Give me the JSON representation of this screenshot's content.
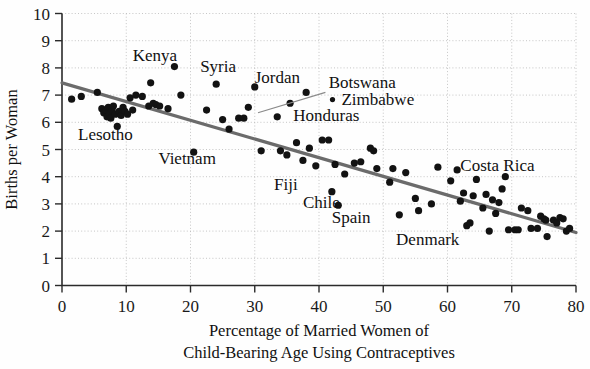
{
  "chart_data": {
    "type": "scatter",
    "title": "",
    "xlabel": "Percentage of Married Women of Child-Bearing Age Using Contraceptives",
    "xlabel_line1": "Percentage of Married Women of",
    "xlabel_line2": "Child-Bearing Age Using Contraceptives",
    "ylabel": "Births per Woman",
    "xlim": [
      0,
      80
    ],
    "ylim": [
      0,
      10
    ],
    "xticks": [
      0,
      10,
      20,
      30,
      40,
      50,
      60,
      70,
      80
    ],
    "yticks": [
      0,
      1,
      2,
      3,
      4,
      5,
      6,
      7,
      8,
      9,
      10
    ],
    "xtick_labels": [
      "0",
      "10",
      "20",
      "30",
      "40",
      "50",
      "60",
      "70",
      "80"
    ],
    "ytick_labels": [
      "0",
      "1",
      "2",
      "3",
      "4",
      "5",
      "6",
      "7",
      "8",
      "9",
      "10"
    ],
    "grid": true,
    "legend": "none",
    "marker_color": "#121212",
    "trend_color": "#6b6b6b",
    "trend_line": {
      "name": "least-squares regression line",
      "x1": 0,
      "y1": 7.45,
      "x2": 80,
      "y2": 1.95
    },
    "points": [
      {
        "x": 1.5,
        "y": 6.85
      },
      {
        "x": 3.0,
        "y": 6.95
      },
      {
        "x": 5.5,
        "y": 7.1
      },
      {
        "x": 6.2,
        "y": 6.5
      },
      {
        "x": 6.5,
        "y": 6.35
      },
      {
        "x": 6.8,
        "y": 6.45
      },
      {
        "x": 7.0,
        "y": 6.2
      },
      {
        "x": 7.2,
        "y": 6.55
      },
      {
        "x": 7.4,
        "y": 6.3
      },
      {
        "x": 7.6,
        "y": 6.15
      },
      {
        "x": 7.8,
        "y": 6.45
      },
      {
        "x": 8.0,
        "y": 6.6
      },
      {
        "x": 8.3,
        "y": 6.3
      },
      {
        "x": 8.6,
        "y": 5.85
      },
      {
        "x": 8.9,
        "y": 6.4
      },
      {
        "x": 9.2,
        "y": 6.25
      },
      {
        "x": 9.5,
        "y": 6.55
      },
      {
        "x": 9.8,
        "y": 6.4
      },
      {
        "x": 10.2,
        "y": 6.3
      },
      {
        "x": 10.6,
        "y": 6.9
      },
      {
        "x": 11.0,
        "y": 6.45
      },
      {
        "x": 11.5,
        "y": 7.0
      },
      {
        "x": 12.5,
        "y": 6.95
      },
      {
        "x": 13.5,
        "y": 6.6
      },
      {
        "x": 13.8,
        "y": 7.45
      },
      {
        "x": 14.2,
        "y": 6.7
      },
      {
        "x": 14.6,
        "y": 6.65
      },
      {
        "x": 15.2,
        "y": 6.6
      },
      {
        "x": 16.5,
        "y": 6.5
      },
      {
        "x": 17.5,
        "y": 8.05
      },
      {
        "x": 18.5,
        "y": 7.0
      },
      {
        "x": 20.5,
        "y": 4.9
      },
      {
        "x": 22.5,
        "y": 6.45
      },
      {
        "x": 24.0,
        "y": 7.4
      },
      {
        "x": 25.0,
        "y": 6.1
      },
      {
        "x": 26.0,
        "y": 5.75
      },
      {
        "x": 27.5,
        "y": 6.15
      },
      {
        "x": 28.3,
        "y": 6.15
      },
      {
        "x": 29.0,
        "y": 6.55
      },
      {
        "x": 30.0,
        "y": 7.3
      },
      {
        "x": 31.0,
        "y": 4.95
      },
      {
        "x": 33.5,
        "y": 6.2
      },
      {
        "x": 34.0,
        "y": 4.95
      },
      {
        "x": 35.0,
        "y": 4.8
      },
      {
        "x": 35.5,
        "y": 6.7
      },
      {
        "x": 36.5,
        "y": 5.25
      },
      {
        "x": 37.5,
        "y": 4.6
      },
      {
        "x": 38.0,
        "y": 7.1
      },
      {
        "x": 38.5,
        "y": 5.05
      },
      {
        "x": 39.5,
        "y": 4.4
      },
      {
        "x": 40.5,
        "y": 5.35
      },
      {
        "x": 41.5,
        "y": 5.35
      },
      {
        "x": 42.0,
        "y": 3.45
      },
      {
        "x": 42.5,
        "y": 4.45
      },
      {
        "x": 43.0,
        "y": 2.95
      },
      {
        "x": 44.0,
        "y": 4.1
      },
      {
        "x": 45.5,
        "y": 4.5
      },
      {
        "x": 46.5,
        "y": 4.55
      },
      {
        "x": 48.0,
        "y": 5.05
      },
      {
        "x": 48.5,
        "y": 4.95
      },
      {
        "x": 49.0,
        "y": 4.3
      },
      {
        "x": 51.0,
        "y": 3.8
      },
      {
        "x": 51.5,
        "y": 4.3
      },
      {
        "x": 52.5,
        "y": 2.6
      },
      {
        "x": 53.5,
        "y": 4.15
      },
      {
        "x": 55.0,
        "y": 3.2
      },
      {
        "x": 55.5,
        "y": 2.75
      },
      {
        "x": 57.5,
        "y": 3.0
      },
      {
        "x": 58.5,
        "y": 4.35
      },
      {
        "x": 60.5,
        "y": 3.85
      },
      {
        "x": 61.5,
        "y": 4.25
      },
      {
        "x": 62.0,
        "y": 3.1
      },
      {
        "x": 62.5,
        "y": 3.4
      },
      {
        "x": 63.0,
        "y": 2.2
      },
      {
        "x": 63.5,
        "y": 2.3
      },
      {
        "x": 64.0,
        "y": 3.3
      },
      {
        "x": 64.5,
        "y": 3.9
      },
      {
        "x": 65.5,
        "y": 2.85
      },
      {
        "x": 66.0,
        "y": 3.35
      },
      {
        "x": 66.5,
        "y": 2.0
      },
      {
        "x": 67.0,
        "y": 3.15
      },
      {
        "x": 67.5,
        "y": 2.65
      },
      {
        "x": 68.0,
        "y": 3.05
      },
      {
        "x": 68.5,
        "y": 3.55
      },
      {
        "x": 69.0,
        "y": 4.0
      },
      {
        "x": 69.5,
        "y": 2.05
      },
      {
        "x": 70.5,
        "y": 2.05
      },
      {
        "x": 71.0,
        "y": 2.05
      },
      {
        "x": 71.5,
        "y": 2.85
      },
      {
        "x": 72.5,
        "y": 2.75
      },
      {
        "x": 73.0,
        "y": 2.1
      },
      {
        "x": 74.0,
        "y": 2.1
      },
      {
        "x": 74.5,
        "y": 2.55
      },
      {
        "x": 75.0,
        "y": 2.45
      },
      {
        "x": 75.3,
        "y": 2.4
      },
      {
        "x": 75.5,
        "y": 1.8
      },
      {
        "x": 76.5,
        "y": 2.4
      },
      {
        "x": 77.0,
        "y": 2.3
      },
      {
        "x": 77.5,
        "y": 2.5
      },
      {
        "x": 78.0,
        "y": 2.45
      },
      {
        "x": 78.5,
        "y": 2.0
      },
      {
        "x": 79.0,
        "y": 2.1
      }
    ],
    "annotations": [
      {
        "name": "Kenya",
        "text": "Kenya",
        "x": 11.0,
        "y": 8.25,
        "anchor": "start"
      },
      {
        "name": "Syria",
        "text": "Syria",
        "x": 21.5,
        "y": 7.85,
        "anchor": "start"
      },
      {
        "name": "Jordan",
        "text": "Jordan",
        "x": 30.0,
        "y": 7.45,
        "anchor": "start"
      },
      {
        "name": "Botswana",
        "text": "Botswana",
        "x": 41.5,
        "y": 7.25,
        "anchor": "start"
      },
      {
        "name": "Zimbabwe",
        "text": "Zimbabwe",
        "x": 43.5,
        "y": 6.65,
        "anchor": "start"
      },
      {
        "name": "Honduras",
        "text": "Honduras",
        "x": 36.0,
        "y": 6.05,
        "anchor": "start"
      },
      {
        "name": "Lesotho",
        "text": "Lesotho",
        "x": 2.5,
        "y": 5.35,
        "anchor": "start"
      },
      {
        "name": "Vietnam",
        "text": "Vietnam",
        "x": 15.0,
        "y": 4.45,
        "anchor": "start"
      },
      {
        "name": "Costa Rica",
        "text": "Costa Rica",
        "x": 62.0,
        "y": 4.2,
        "anchor": "start"
      },
      {
        "name": "Fiji",
        "text": "Fiji",
        "x": 33.0,
        "y": 3.5,
        "anchor": "start"
      },
      {
        "name": "Chile",
        "text": "Chile",
        "x": 37.5,
        "y": 2.85,
        "anchor": "start"
      },
      {
        "name": "Spain",
        "text": "Spain",
        "x": 42.0,
        "y": 2.3,
        "anchor": "start"
      },
      {
        "name": "Denmark",
        "text": "Denmark",
        "x": 52.0,
        "y": 1.5,
        "anchor": "start"
      }
    ],
    "leader_lines": [
      {
        "name": "botswana-leader",
        "x1": 41.0,
        "y1": 7.1,
        "x2": 30.5,
        "y2": 6.35
      }
    ]
  }
}
